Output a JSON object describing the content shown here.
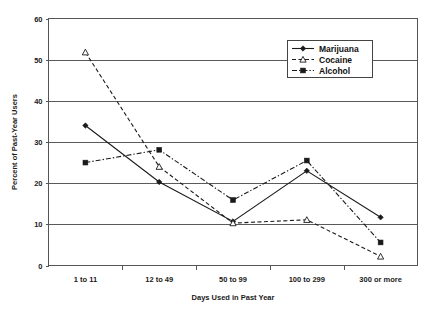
{
  "chart_data": {
    "type": "line",
    "title": "",
    "xlabel": "Days Used in Past Year",
    "ylabel": "Percent of Past-Year Users",
    "categories": [
      "1 to 11",
      "12 to 49",
      "50 to 99",
      "100 to 299",
      "300 or more"
    ],
    "ylim": [
      0,
      60
    ],
    "yticks": [
      0,
      10,
      20,
      30,
      40,
      50,
      60
    ],
    "grid": true,
    "legend_position": "top-right",
    "series": [
      {
        "name": "Marijuana",
        "values": [
          34.0,
          20.3,
          10.7,
          23.0,
          11.7
        ],
        "line_style": "solid",
        "marker": "diamond",
        "color": "#1a1a1a"
      },
      {
        "name": "Cocaine",
        "values": [
          51.8,
          24.0,
          10.3,
          11.1,
          2.2
        ],
        "line_style": "dashed",
        "marker": "triangle",
        "color": "#1a1a1a"
      },
      {
        "name": "Alcohol",
        "values": [
          25.0,
          28.1,
          15.9,
          25.5,
          5.6
        ],
        "line_style": "dashdot",
        "marker": "square",
        "color": "#1a1a1a"
      }
    ]
  },
  "axis": {
    "y_tick_labels": [
      "0",
      "10",
      "20",
      "30",
      "40",
      "50",
      "60"
    ],
    "y_title": "Percent of Past-Year Users",
    "x_title": "Days Used in Past Year",
    "x_tick_labels": [
      "1 to 11",
      "12 to 49",
      "50 to 99",
      "100 to 299",
      "300 or more"
    ]
  },
  "legend": {
    "items": [
      {
        "label": "Marijuana"
      },
      {
        "label": "Cocaine"
      },
      {
        "label": "Alcohol"
      }
    ]
  }
}
